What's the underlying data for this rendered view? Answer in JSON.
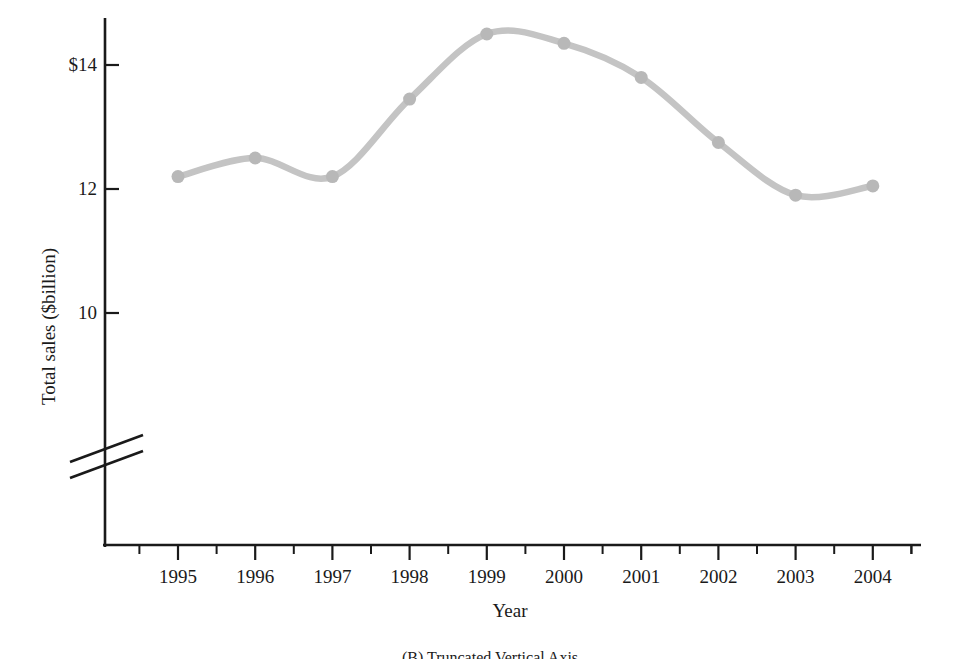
{
  "chart_data": {
    "type": "line",
    "title": "",
    "xlabel": "Year",
    "ylabel": "Total sales ($billion)",
    "categories": [
      "1995",
      "1996",
      "1997",
      "1998",
      "1999",
      "2000",
      "2001",
      "2002",
      "2003",
      "2004"
    ],
    "x": [
      1995,
      1996,
      1997,
      1998,
      1999,
      2000,
      2001,
      2002,
      2003,
      2004
    ],
    "values": [
      12.2,
      12.5,
      12.2,
      13.45,
      14.5,
      14.35,
      13.8,
      12.75,
      11.9,
      12.05
    ],
    "series": [
      {
        "name": "Total sales",
        "values": [
          12.2,
          12.5,
          12.2,
          13.45,
          14.5,
          14.35,
          13.8,
          12.75,
          11.9,
          12.05
        ]
      }
    ],
    "ylim": [
      9.2,
      14.9
    ],
    "xlim": [
      1994.3,
      2004.7
    ],
    "ytick_labels": [
      "$14",
      "12",
      "10"
    ],
    "ytick_values": [
      14,
      12,
      10
    ],
    "xtick_labels": [
      "1995",
      "1996",
      "1997",
      "1998",
      "1999",
      "2000",
      "2001",
      "2002",
      "2003",
      "2004"
    ],
    "minor_ticks": true,
    "grid": false,
    "legend": "none",
    "axis_break": "truncated vertical axis",
    "line_color": "#c4c4c4",
    "marker_color": "#b8b8b8",
    "axis_color": "#1a1a1a",
    "marker": "circle",
    "annotations": []
  },
  "caption": {
    "text": "(B) Truncated Vertical Axis"
  },
  "axes": {
    "y_title": "Total sales ($billion)",
    "x_title": "Year"
  }
}
